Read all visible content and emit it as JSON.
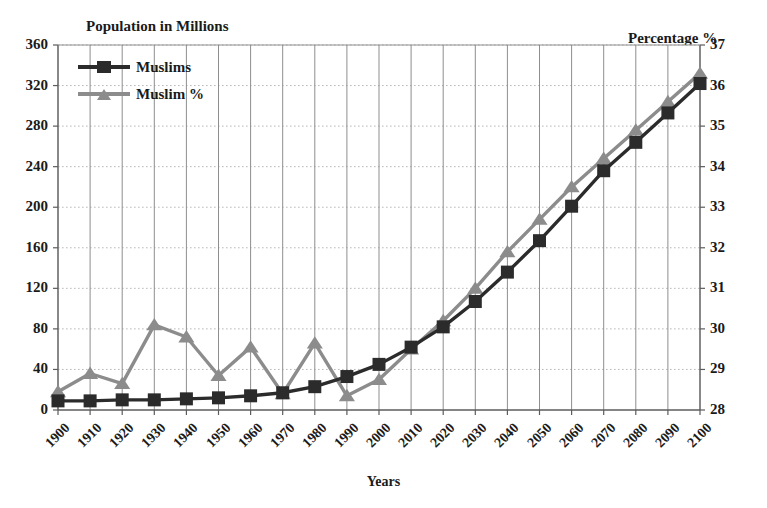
{
  "chart_data": {
    "type": "line",
    "title": "",
    "xlabel": "Years",
    "grid": true,
    "legend_position": "top-left-inside",
    "categories": [
      "1900",
      "1910",
      "1920",
      "1930",
      "1940",
      "1950",
      "1960",
      "1970",
      "1980",
      "1990",
      "2000",
      "2010",
      "2020",
      "2030",
      "2040",
      "2050",
      "2060",
      "2070",
      "2080",
      "2090",
      "2100"
    ],
    "axes": {
      "left": {
        "label": "Population in Millions",
        "min": 0,
        "max": 360,
        "step": 40,
        "ticks": [
          "0",
          "40",
          "80",
          "120",
          "160",
          "200",
          "240",
          "280",
          "320",
          "360"
        ]
      },
      "right": {
        "label": "Percentage %",
        "min": 28,
        "max": 37,
        "step": 1,
        "ticks": [
          "28",
          "29",
          "30",
          "31",
          "32",
          "33",
          "34",
          "35",
          "36",
          "37"
        ]
      }
    },
    "series": [
      {
        "name": "Muslims",
        "axis": "left",
        "unit": "millions",
        "marker": "square",
        "color": "#2b2b2b",
        "values": [
          9,
          9,
          10,
          10,
          11,
          12,
          14,
          17,
          23,
          33,
          45,
          62,
          82,
          107,
          136,
          167,
          201,
          236,
          264,
          293,
          322
        ]
      },
      {
        "name": "Muslim %",
        "axis": "right",
        "unit": "percent",
        "marker": "triangle",
        "color": "#8c8c8c",
        "values": [
          28.45,
          28.9,
          28.65,
          30.1,
          29.8,
          28.85,
          29.55,
          28.4,
          29.65,
          28.35,
          28.75,
          29.5,
          30.2,
          31.0,
          31.9,
          32.7,
          33.5,
          34.2,
          34.9,
          35.6,
          36.3
        ]
      }
    ]
  },
  "legend": {
    "items": [
      {
        "label": "Muslims",
        "marker": "square",
        "color": "#2b2b2b"
      },
      {
        "label": "Muslim %",
        "marker": "triangle",
        "color": "#8c8c8c"
      }
    ]
  },
  "labels": {
    "left_axis_title": "Population in Millions",
    "right_axis_title": "Percentage %",
    "x_axis_title": "Years"
  }
}
